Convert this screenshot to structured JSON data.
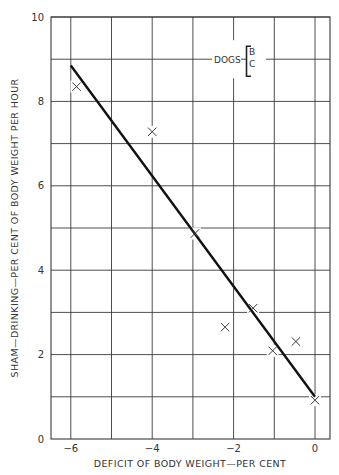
{
  "chart_data": {
    "type": "scatter",
    "title": "",
    "xlabel": "DEFICIT OF BODY WEIGHT—PER CENT",
    "ylabel": "SHAM—DRINKING—PER CENT OF BODY WEIGHT PER HOUR",
    "xlim": [
      -6.5,
      0.35
    ],
    "ylim": [
      0,
      10
    ],
    "x_ticks": [
      -6,
      -4,
      -2,
      0
    ],
    "x_tick_labels": [
      "−6",
      "−4",
      "−2",
      "0"
    ],
    "x_grid": [
      -6,
      -5,
      -4,
      -3,
      -2,
      -1,
      0
    ],
    "y_ticks": [
      0,
      2,
      4,
      6,
      8,
      10
    ],
    "y_tick_labels": [
      "0",
      "2",
      "4",
      "6",
      "8",
      "10"
    ],
    "y_grid": [
      1,
      2,
      3,
      4,
      5,
      6,
      7,
      8,
      9,
      10
    ],
    "grid": true,
    "series": [
      {
        "name": "Dogs B, C",
        "marker": "x",
        "x": [
          -5.86,
          -4.0,
          -2.95,
          -2.21,
          -1.52,
          -1.04,
          -0.47,
          0.0
        ],
        "y": [
          8.35,
          7.28,
          4.87,
          2.65,
          3.1,
          2.09,
          2.31,
          0.92
        ]
      }
    ],
    "fit_line": {
      "name": "regression",
      "x": [
        -6.0,
        0.0
      ],
      "y": [
        8.85,
        1.0
      ]
    },
    "legend": {
      "label": "DOGS",
      "entries": [
        "B",
        "C"
      ],
      "position": "upper right",
      "anchor_y": 9
    },
    "colors": {
      "grid": "#3a3a3a",
      "line": "#111111",
      "marker": "#3a3a3a",
      "text": "#333333"
    }
  }
}
